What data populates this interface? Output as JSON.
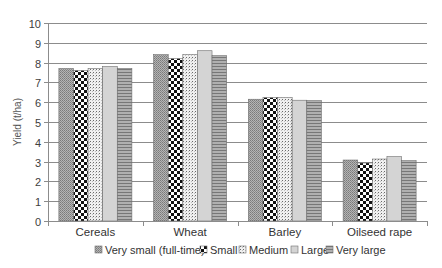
{
  "chart_data": {
    "type": "bar",
    "title": "",
    "xlabel": "",
    "ylabel": "Yield (t/ha)",
    "ylim": [
      0,
      10
    ],
    "yticks": [
      0,
      1,
      2,
      3,
      4,
      5,
      6,
      7,
      8,
      9,
      10
    ],
    "grid": true,
    "legend_position": "bottom",
    "categories": [
      "Cereals",
      "Wheat",
      "Barley",
      "Oilseed rape"
    ],
    "series": [
      {
        "name": "Very small (full-time)",
        "pattern": "fine-crosshatch",
        "values": [
          7.7,
          8.4,
          6.15,
          3.08
        ]
      },
      {
        "name": "Small",
        "pattern": "checkerboard",
        "values": [
          7.6,
          8.2,
          6.23,
          2.93
        ]
      },
      {
        "name": "Medium",
        "pattern": "dotted-grid",
        "values": [
          7.7,
          8.4,
          6.23,
          3.13
        ]
      },
      {
        "name": "Large",
        "pattern": "light-solid",
        "values": [
          7.8,
          8.6,
          6.1,
          3.25
        ]
      },
      {
        "name": "Very large",
        "pattern": "horizontal-stripes",
        "values": [
          7.7,
          8.35,
          6.08,
          3.05
        ]
      }
    ]
  },
  "colors": {
    "gridline": "#8c8c8c",
    "axis": "#8c8c8c",
    "bar_border": "#6e6e6e"
  }
}
